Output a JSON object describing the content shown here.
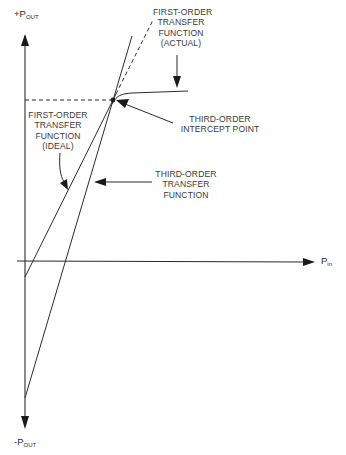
{
  "diagram": {
    "axes": {
      "y_top": {
        "prefix": "+P",
        "sub": "OUT"
      },
      "y_bottom": {
        "prefix": "-P",
        "sub": "OUT"
      },
      "x_right": {
        "prefix": "P",
        "sub": "in"
      }
    },
    "labels": {
      "first_order_actual": "FIRST-ORDER\nTRANSFER\nFUNCTION\n(ACTUAL)",
      "first_order_ideal": "FIRST-ORDER\nTRANSFER\nFUNCTION\n(IDEAL)",
      "intercept_point": "THIRD-ORDER\nINTERCEPT POINT",
      "third_order": "THIRD-ORDER\nTRANSFER\nFUNCTION"
    },
    "colors": {
      "line": "#2b2b2b",
      "text": "#3a3a3a",
      "background": "#ffffff"
    }
  }
}
